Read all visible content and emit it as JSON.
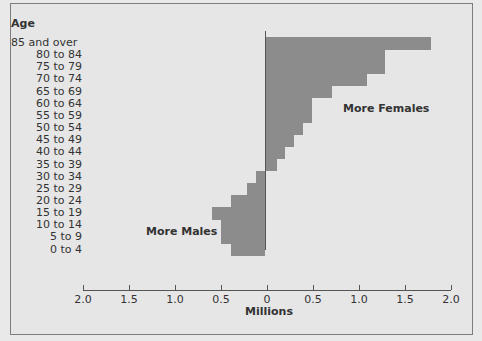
{
  "chart_data": {
    "type": "bar",
    "orientation": "horizontal",
    "title": "",
    "ylabel": "Age",
    "xlabel": "Millions",
    "categories": [
      "85 and over",
      "80 to 84",
      "75 to 79",
      "70 to 74",
      "65 to 69",
      "60 to 64",
      "55 to 59",
      "50 to 54",
      "45 to 49",
      "40 to 44",
      "35 to 39",
      "30 to 34",
      "25 to 29",
      "20 to 24",
      "15 to 19",
      "10 to 14",
      "5 to 9",
      "0 to 4"
    ],
    "values": [
      1.8,
      1.3,
      1.3,
      1.1,
      0.72,
      0.51,
      0.51,
      0.41,
      0.31,
      0.21,
      0.12,
      -0.1,
      -0.2,
      -0.38,
      -0.58,
      -0.48,
      -0.48,
      -0.38
    ],
    "x_ticks": [
      "2.0",
      "1.5",
      "1.0",
      "0.5",
      "0",
      "0.5",
      "1.0",
      "1.5",
      "2.0"
    ],
    "xlim": [
      -2.0,
      2.0
    ],
    "annotations": [
      "More Females",
      "More Males"
    ],
    "grid": false,
    "bar_color": "#8c8c8c"
  },
  "labels": {
    "age": "Age",
    "millions": "Millions",
    "more_females": "More Females",
    "more_males": "More Males"
  }
}
